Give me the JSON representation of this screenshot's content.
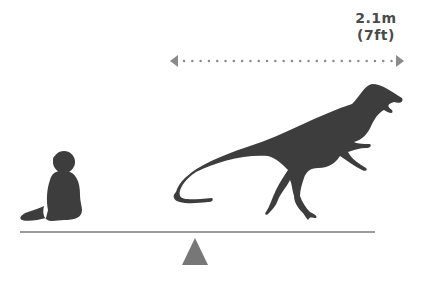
{
  "diagram": {
    "type": "size-comparison",
    "measurement": {
      "metric": "2.1m",
      "imperial": "(7ft)"
    },
    "subjects": [
      {
        "name": "human-baby",
        "description": "sitting baby silhouette"
      },
      {
        "name": "dinosaur",
        "description": "theropod dinosaur silhouette"
      }
    ],
    "colors": {
      "silhouette": "#3d3d3d",
      "arrow": "#8a8a8a",
      "text": "#4a4a4a",
      "ground": "#7a7a7a",
      "fulcrum": "#777777"
    }
  }
}
